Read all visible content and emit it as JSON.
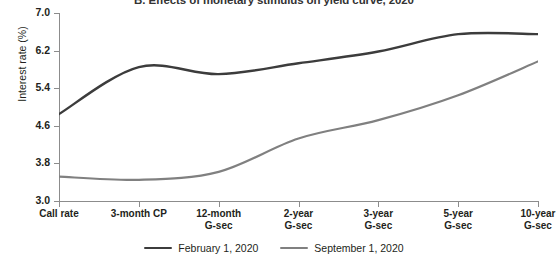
{
  "chart_data": {
    "type": "line",
    "title": "B. Effects of monetary stimulus on yield curve, 2020",
    "xlabel": "",
    "ylabel": "Interest rate (%)",
    "ylim": [
      3.0,
      7.0
    ],
    "yticks": [
      "3.0",
      "3.8",
      "4.6",
      "5.4",
      "6.2",
      "7.0"
    ],
    "ytick_values": [
      3.0,
      3.8,
      4.6,
      5.4,
      6.2,
      7.0
    ],
    "grid": false,
    "legend_position": "bottom-center",
    "categories": [
      "Call rate",
      "3-month CP",
      "12-month\nG-sec",
      "2-year\nG-sec",
      "3-year\nG-sec",
      "5-year\nG-sec",
      "10-year\nG-sec"
    ],
    "category_lines": [
      [
        "Call rate",
        ""
      ],
      [
        "3-month CP",
        ""
      ],
      [
        "12-month",
        "G-sec"
      ],
      [
        "2-year",
        "G-sec"
      ],
      [
        "3-year",
        "G-sec"
      ],
      [
        "5-year",
        "G-sec"
      ],
      [
        "10-year",
        "G-sec"
      ]
    ],
    "series": [
      {
        "name": "February 1, 2020",
        "color": "#3c3c3c",
        "values": [
          4.85,
          5.85,
          5.7,
          5.93,
          6.18,
          6.55,
          6.55
        ]
      },
      {
        "name": "September 1, 2020",
        "color": "#808080",
        "values": [
          3.52,
          3.45,
          3.62,
          4.33,
          4.72,
          5.25,
          5.97
        ]
      }
    ]
  },
  "legend": {
    "entries": [
      {
        "label": "February 1, 2020",
        "color": "#3c3c3c"
      },
      {
        "label": "September 1, 2020",
        "color": "#808080"
      }
    ]
  }
}
